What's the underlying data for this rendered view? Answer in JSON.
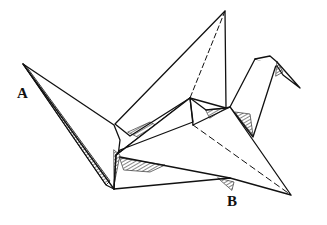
{
  "figure": {
    "labels": [
      {
        "id": "A",
        "text": "A",
        "points_to": "left wing tip"
      },
      {
        "id": "B",
        "text": "B",
        "points_to": "underside near tail"
      }
    ],
    "colors": {
      "ink": "#111111",
      "background": "#ffffff"
    }
  }
}
